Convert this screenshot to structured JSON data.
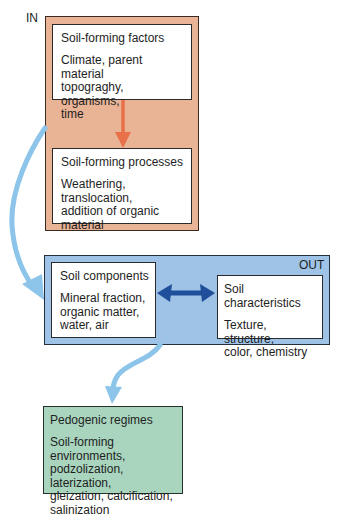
{
  "diagram": {
    "in_label": "IN",
    "out_label": "OUT",
    "factors": {
      "title": "Soil-forming factors",
      "body": "Climate, parent material\ntopograghy, organisms,\ntime"
    },
    "processes": {
      "title": "Soil-forming processes",
      "body": "Weathering, translocation,\naddition of organic\nmaterial"
    },
    "components": {
      "title": "Soil components",
      "body": "Mineral fraction,\norganic matter,\nwater, air"
    },
    "characteristics": {
      "title": "Soil characteristics",
      "body": "Texture, structure,\ncolor, chemistry"
    },
    "regimes": {
      "title": "Pedogenic regimes",
      "body": "Soil-forming environments,\npodzolization, laterization,\ngleization, calcification,\nsalinization"
    },
    "colors": {
      "in_panel": "#e9b396",
      "out_panel": "#9ec3e6",
      "regimes_panel": "#a9d5be",
      "red_arrow": "#e8714a",
      "blue_flow_arrow": "#8cc4ea",
      "double_arrow": "#1f4f9a"
    },
    "icons": [
      "down-arrow-icon",
      "double-arrow-icon",
      "curved-arrow-icon"
    ]
  }
}
